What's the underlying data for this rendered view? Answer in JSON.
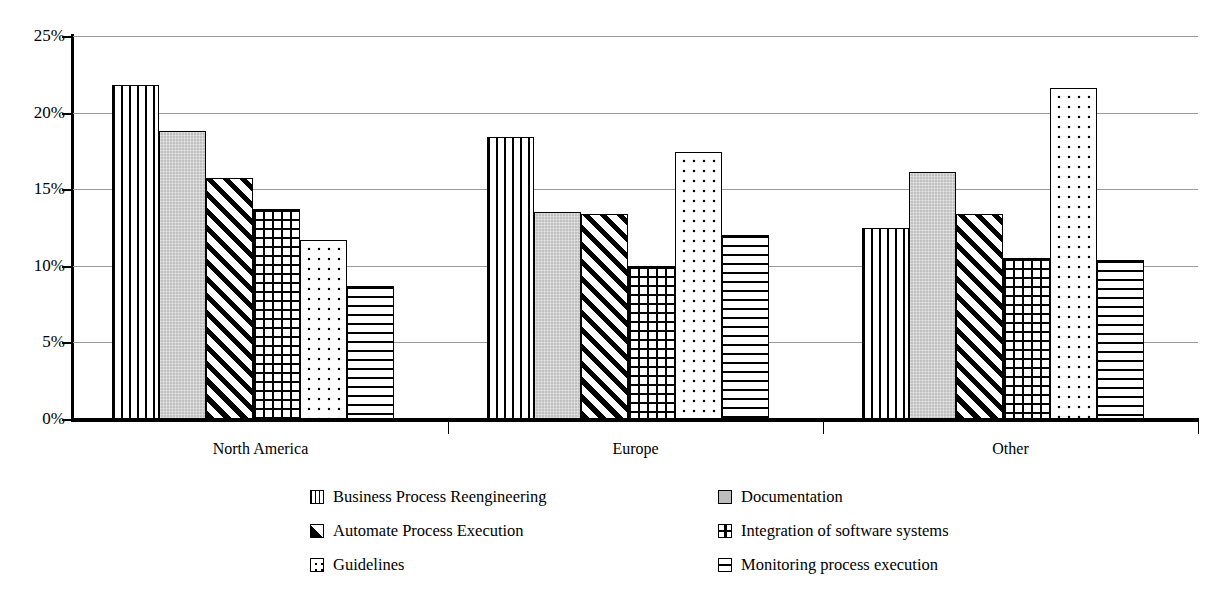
{
  "chart_data": {
    "type": "bar",
    "title": "",
    "xlabel": "",
    "ylabel": "",
    "ylim": [
      0,
      25
    ],
    "ytick_labels": [
      "0%",
      "5%",
      "10%",
      "15%",
      "20%",
      "25%"
    ],
    "ytick_values": [
      0,
      5,
      10,
      15,
      20,
      25
    ],
    "grid": true,
    "legend_position": "bottom",
    "value_suffix": "%",
    "categories": [
      "North America",
      "Europe",
      "Other"
    ],
    "series": [
      {
        "name": "Business Process Reengineering",
        "pattern": "vertical-lines",
        "values": [
          21.8,
          18.4,
          12.5
        ]
      },
      {
        "name": "Documentation",
        "pattern": "solid-gray",
        "values": [
          18.8,
          13.5,
          16.1
        ]
      },
      {
        "name": "Automate Process Execution",
        "pattern": "diagonal-hatch",
        "values": [
          15.7,
          13.4,
          13.4
        ]
      },
      {
        "name": "Integration of software systems",
        "pattern": "grid",
        "values": [
          13.7,
          10.0,
          10.5
        ]
      },
      {
        "name": "Guidelines",
        "pattern": "dots",
        "values": [
          11.7,
          17.4,
          21.6
        ]
      },
      {
        "name": "Monitoring process execution",
        "pattern": "horizontal-lines",
        "values": [
          8.7,
          12.0,
          10.4
        ]
      }
    ]
  },
  "legend": {
    "left_column": [
      {
        "label": "Business Process Reengineering",
        "swatch": "vertical-lines-swatch"
      },
      {
        "label": "Automate Process Execution",
        "swatch": "diagonal-hatch-swatch"
      },
      {
        "label": "Guidelines",
        "swatch": "dots-swatch"
      }
    ],
    "right_column": [
      {
        "label": "Documentation",
        "swatch": "solid-gray-swatch"
      },
      {
        "label": "Integration of software systems",
        "swatch": "grid-swatch"
      },
      {
        "label": "Monitoring process execution",
        "swatch": "horizontal-lines-swatch"
      }
    ]
  },
  "colors": {
    "axis": "#000000",
    "gridline": "#9a9a9a",
    "bar_outline": "#000000",
    "documentation_fill": "#c0c0c0",
    "background": "#ffffff"
  }
}
